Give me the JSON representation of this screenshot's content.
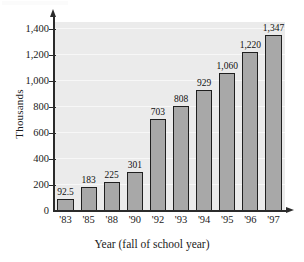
{
  "chart_data": {
    "type": "bar",
    "title": "",
    "subtitle": "",
    "xlabel": "Year (fall of school year)",
    "ylabel": "Thousands",
    "categories": [
      "'83",
      "'85",
      "'88",
      "'90",
      "'92",
      "'93",
      "'94",
      "'95",
      "'96",
      "'97"
    ],
    "values": [
      92.5,
      183,
      225,
      301,
      703,
      808,
      929,
      1060,
      1220,
      1347
    ],
    "value_labels": [
      "92.5",
      "183",
      "225",
      "301",
      "703",
      "808",
      "929",
      "1,060",
      "1,220",
      "1,347"
    ],
    "series": [
      {
        "name": "Thousands",
        "values": [
          92.5,
          183,
          225,
          301,
          703,
          808,
          929,
          1060,
          1220,
          1347
        ]
      }
    ],
    "ylim": [
      0,
      1450
    ],
    "yticks": [
      0,
      200,
      400,
      600,
      800,
      1000,
      1200,
      1400
    ],
    "ytick_labels": [
      "0",
      "200",
      "400",
      "600",
      "800",
      "1,000",
      "1,200",
      "1,400"
    ],
    "grid": true,
    "grid_axis": "y",
    "legend": false,
    "legend_position": "none",
    "annotations": [],
    "colors": {
      "bar_fill": "#a8a8a8",
      "bar_edge": "#1f1f1f",
      "plot_background": "#ebebeb",
      "gridline": "#f7f7f7",
      "axis": "#2b2b2b",
      "text": "#1a1a1a",
      "page_background": "#ffffff"
    }
  }
}
